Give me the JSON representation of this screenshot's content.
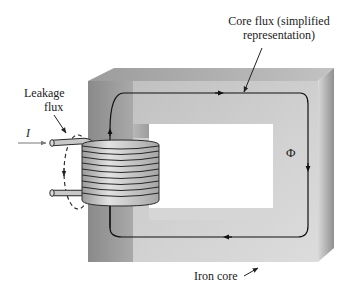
{
  "diagram": {
    "type": "magnetic-circuit",
    "labels": {
      "core_flux": "Core flux (simplified",
      "core_flux_line2": "representation)",
      "leakage": "Leakage",
      "leakage_line2": "flux",
      "current": "I",
      "flux_symbol": "Φ",
      "iron_core": "Iron core"
    },
    "colors": {
      "core_front": "#c9c9c9",
      "core_top": "#a8a8a8",
      "core_side": "#9a9a9a",
      "core_dark_leg": "#8e8e8e",
      "window": "#ffffff",
      "window_shadow": "#d8d8d8",
      "coil": "#c4c4c4",
      "coil_outline": "#2a2a2a",
      "flux_line": "#111111",
      "arrow_gray": "#777777"
    }
  }
}
